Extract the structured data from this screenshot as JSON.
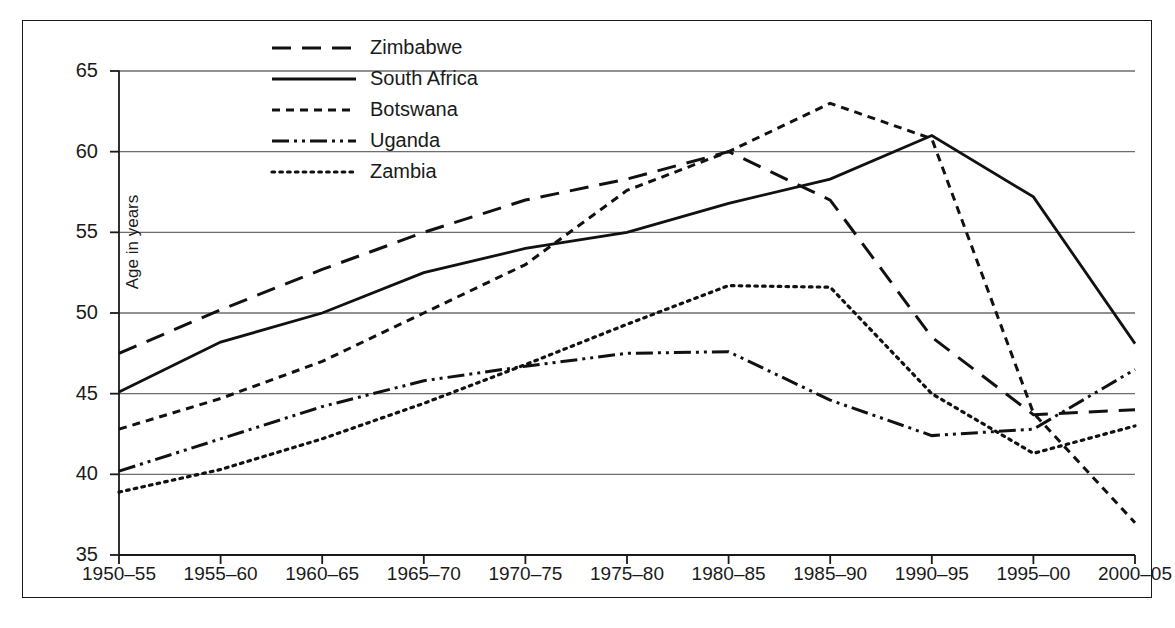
{
  "chart_data": {
    "type": "line",
    "title": "",
    "xlabel": "",
    "ylabel": "Age in years",
    "categories": [
      "1950–55",
      "1955–60",
      "1960–65",
      "1965–70",
      "1970–75",
      "1975–80",
      "1980–85",
      "1985–90",
      "1990–95",
      "1995–00",
      "2000–05"
    ],
    "ylim": [
      35,
      65
    ],
    "yticks": [
      35,
      40,
      45,
      50,
      55,
      60,
      65
    ],
    "grid": true,
    "legend_position": "top-center",
    "series": [
      {
        "name": "Zimbabwe",
        "dash": "long-dash",
        "values": [
          47.5,
          50.2,
          52.7,
          55.0,
          57.0,
          58.3,
          60.0,
          57.0,
          48.5,
          43.7,
          44.0
        ]
      },
      {
        "name": "South Africa",
        "dash": "solid",
        "values": [
          45.1,
          48.2,
          50.0,
          52.5,
          54.0,
          55.0,
          56.8,
          58.3,
          61.0,
          57.2,
          48.1
        ]
      },
      {
        "name": "Botswana",
        "dash": "short-dash",
        "values": [
          42.8,
          44.7,
          47.0,
          50.0,
          53.0,
          57.6,
          60.0,
          63.0,
          60.8,
          43.8,
          37.0
        ]
      },
      {
        "name": "Uganda",
        "dash": "dash-dot-dot",
        "values": [
          40.2,
          42.2,
          44.2,
          45.8,
          46.7,
          47.5,
          47.6,
          44.6,
          42.4,
          42.8,
          46.5
        ]
      },
      {
        "name": "Zambia",
        "dash": "dotted",
        "values": [
          38.9,
          40.3,
          42.2,
          44.4,
          46.8,
          49.3,
          51.7,
          51.6,
          45.0,
          41.3,
          43.0
        ]
      }
    ]
  },
  "legend": {
    "items": [
      {
        "label": "Zimbabwe"
      },
      {
        "label": "South Africa"
      },
      {
        "label": "Botswana"
      },
      {
        "label": "Uganda"
      },
      {
        "label": "Zambia"
      }
    ]
  },
  "axis": {
    "y_label": "Age in years",
    "y_ticks": [
      "65",
      "60",
      "55",
      "50",
      "45",
      "40",
      "35"
    ],
    "x_ticks": [
      "1950–55",
      "1955–60",
      "1960–65",
      "1965–70",
      "1970–75",
      "1975–80",
      "1980–85",
      "1985–90",
      "1990–95",
      "1995–00",
      "2000–05"
    ]
  },
  "colors": {
    "line": "#111111",
    "grid": "#6d6d6d",
    "frame": "#1a1a1a",
    "background": "#ffffff"
  }
}
